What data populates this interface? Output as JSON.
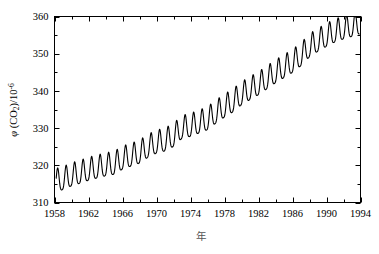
{
  "chart_data": {
    "type": "line",
    "title": "",
    "subtitle": "",
    "xlabel": "年",
    "ylabel": "φ (CO2)/10-6",
    "ylabel_parts": {
      "symbol": "φ",
      "open": " (CO",
      "subscript": "2",
      "close": ")/10",
      "superscript": "-6"
    },
    "xlim": [
      1958,
      1994
    ],
    "ylim": [
      310,
      360
    ],
    "x_major_ticks": [
      1958,
      1962,
      1966,
      1970,
      1974,
      1978,
      1982,
      1986,
      1990,
      1994
    ],
    "x_minor_interval": 2,
    "x_tick_labels": [
      "1958",
      "1962",
      "1966",
      "1970",
      "1974",
      "1978",
      "1982",
      "1986",
      "1990",
      "1994"
    ],
    "y_major_ticks": [
      310,
      320,
      330,
      340,
      350,
      360
    ],
    "y_minor_interval": 5,
    "y_tick_labels": [
      "310",
      "320",
      "330",
      "340",
      "350",
      "360"
    ],
    "grid": false,
    "legend": null,
    "legend_position": "none",
    "line_color": "#000000",
    "line_width": 1.1,
    "frame": true,
    "tick_direction": "in",
    "series": [
      {
        "name": "Atmospheric CO2 mole fraction (Mauna Loa)",
        "description": "Monthly mean CO2 with seasonal cycle superimposed on a rising trend",
        "x_start": 1958.2,
        "x_end": 1993.9,
        "trend_start": 314.7,
        "trend_end": 356.3,
        "seasonal_amplitude": 3.1,
        "seasonal_peak_month_fraction": 0.37,
        "annual_means": [
          {
            "year": 1958,
            "value": 315.3
          },
          {
            "year": 1959,
            "value": 315.9
          },
          {
            "year": 1960,
            "value": 316.9
          },
          {
            "year": 1961,
            "value": 317.6
          },
          {
            "year": 1962,
            "value": 318.4
          },
          {
            "year": 1963,
            "value": 319.0
          },
          {
            "year": 1964,
            "value": 319.6
          },
          {
            "year": 1965,
            "value": 320.0
          },
          {
            "year": 1966,
            "value": 321.4
          },
          {
            "year": 1967,
            "value": 322.2
          },
          {
            "year": 1968,
            "value": 323.0
          },
          {
            "year": 1969,
            "value": 324.6
          },
          {
            "year": 1970,
            "value": 325.7
          },
          {
            "year": 1971,
            "value": 326.3
          },
          {
            "year": 1972,
            "value": 327.5
          },
          {
            "year": 1973,
            "value": 329.7
          },
          {
            "year": 1974,
            "value": 330.2
          },
          {
            "year": 1975,
            "value": 331.1
          },
          {
            "year": 1976,
            "value": 332.0
          },
          {
            "year": 1977,
            "value": 333.8
          },
          {
            "year": 1978,
            "value": 335.4
          },
          {
            "year": 1979,
            "value": 336.8
          },
          {
            "year": 1980,
            "value": 338.7
          },
          {
            "year": 1981,
            "value": 340.1
          },
          {
            "year": 1982,
            "value": 341.4
          },
          {
            "year": 1983,
            "value": 343.0
          },
          {
            "year": 1984,
            "value": 344.6
          },
          {
            "year": 1985,
            "value": 346.0
          },
          {
            "year": 1986,
            "value": 347.4
          },
          {
            "year": 1987,
            "value": 349.2
          },
          {
            "year": 1988,
            "value": 351.6
          },
          {
            "year": 1989,
            "value": 353.1
          },
          {
            "year": 1990,
            "value": 354.4
          },
          {
            "year": 1991,
            "value": 355.6
          },
          {
            "year": 1992,
            "value": 356.4
          },
          {
            "year": 1993,
            "value": 357.1
          }
        ],
        "y_min_observed": 312.5,
        "y_max_observed": 358.6
      }
    ]
  }
}
